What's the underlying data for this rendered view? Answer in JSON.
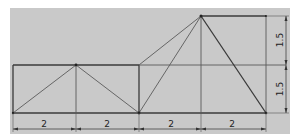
{
  "diagram": {
    "title": "",
    "type": "truss",
    "colors": {
      "panel": "#c9c9c9",
      "member": "#3a3a3a",
      "dimension": "#444444"
    },
    "horizontal_dimensions": [
      {
        "label": "2"
      },
      {
        "label": "2"
      },
      {
        "label": "2"
      },
      {
        "label": "2"
      }
    ],
    "vertical_dimensions": [
      {
        "label": "1.5"
      },
      {
        "label": "1.5"
      }
    ]
  }
}
